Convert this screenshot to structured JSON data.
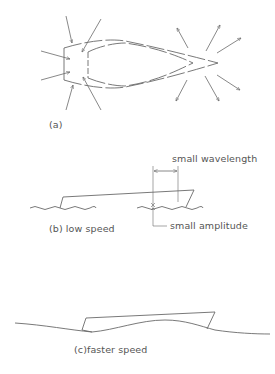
{
  "figure": {
    "panel_a": {
      "label": "(a)"
    },
    "panel_b": {
      "label": "(b) low speed",
      "wavelength_label": "small wavelength",
      "amplitude_label": "small amplitude"
    },
    "panel_c": {
      "label": "(c)faster speed"
    }
  },
  "colors": {
    "line": "#6a6a6a",
    "text": "#555555",
    "background": "#ffffff"
  }
}
